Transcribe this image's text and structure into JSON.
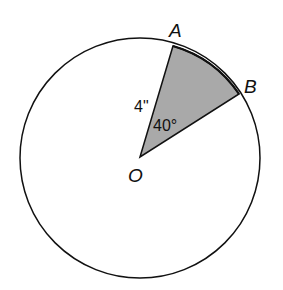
{
  "diagram": {
    "labels": {
      "center": "O",
      "point_a": "A",
      "point_b": "B",
      "radius": "4\"",
      "angle": "40°"
    },
    "colors": {
      "stroke": "#111111",
      "sector_fill": "#a9a9a9",
      "background": "#ffffff"
    }
  }
}
